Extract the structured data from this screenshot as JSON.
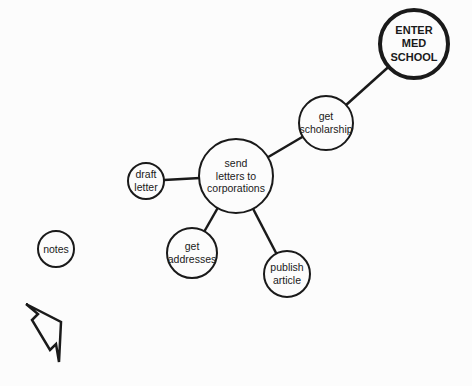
{
  "diagram": {
    "nodes": [
      {
        "id": "enter-med-school",
        "label": "ENTER\nMED\nSCHOOL",
        "cx": 414,
        "cy": 44,
        "r": 36,
        "goal": true
      },
      {
        "id": "get-scholarship",
        "label": "get\nscholarship",
        "cx": 326,
        "cy": 123,
        "r": 28
      },
      {
        "id": "send-letters",
        "label": "send\nletters to\ncorporations",
        "cx": 236,
        "cy": 176,
        "r": 38
      },
      {
        "id": "draft-letter",
        "label": "draft\nletter",
        "cx": 146,
        "cy": 181,
        "r": 19
      },
      {
        "id": "get-addresses",
        "label": "get\naddresses",
        "cx": 192,
        "cy": 253,
        "r": 26
      },
      {
        "id": "publish-article",
        "label": "publish\narticle",
        "cx": 287,
        "cy": 274,
        "r": 24
      },
      {
        "id": "notes",
        "label": "notes",
        "cx": 56,
        "cy": 249,
        "r": 19
      }
    ],
    "edges": [
      {
        "from": "get-scholarship",
        "to": "enter-med-school"
      },
      {
        "from": "send-letters",
        "to": "get-scholarship"
      },
      {
        "from": "draft-letter",
        "to": "send-letters"
      },
      {
        "from": "get-addresses",
        "to": "send-letters"
      },
      {
        "from": "publish-article",
        "to": "send-letters"
      }
    ],
    "colors": {
      "line": "#1a1a1a",
      "background": "#fcfcfc"
    },
    "cursor": {
      "icon": "arrow-cursor-icon",
      "points": "26,304 38,314 32,320 50,350 56,344 59,362 61,322"
    }
  }
}
